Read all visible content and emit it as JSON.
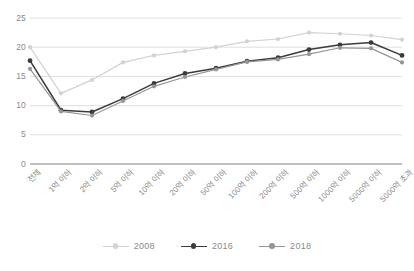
{
  "chart_data": {
    "type": "line",
    "title": "",
    "xlabel": "",
    "ylabel": "",
    "ylim": [
      0,
      25
    ],
    "yticks": [
      0,
      5,
      10,
      15,
      20,
      25
    ],
    "grid": true,
    "legend_position": "bottom",
    "categories": [
      "전체",
      "1억 이하",
      "2억 이하",
      "5억 이하",
      "10억 이하",
      "20억 이하",
      "50억 이하",
      "100억 이하",
      "200억 이하",
      "500억 이하",
      "1000억 이하",
      "5000억 이하",
      "5000억 초과"
    ],
    "series": [
      {
        "name": "2008",
        "color": "#d2d2d2",
        "values": [
          20.0,
          12.1,
          14.4,
          17.4,
          18.6,
          19.3,
          20.0,
          21.0,
          21.4,
          22.5,
          22.3,
          22.0,
          21.3
        ]
      },
      {
        "name": "2016",
        "color": "#3b3b3b",
        "values": [
          17.7,
          9.2,
          8.9,
          11.2,
          13.8,
          15.5,
          16.4,
          17.6,
          18.2,
          19.6,
          20.4,
          20.8,
          18.6
        ]
      },
      {
        "name": "2018",
        "color": "#969696",
        "values": [
          16.3,
          9.0,
          8.3,
          10.8,
          13.3,
          14.9,
          16.2,
          17.5,
          17.9,
          18.8,
          19.9,
          19.8,
          17.4
        ]
      }
    ]
  },
  "axis": {
    "y_tick_labels": [
      "25",
      "20",
      "15",
      "10",
      "5",
      "0"
    ],
    "y_tick_values": [
      25,
      20,
      15,
      10,
      5,
      0
    ]
  },
  "legend": {
    "items": [
      {
        "label": "2008",
        "color": "#d2d2d2"
      },
      {
        "label": "2016",
        "color": "#3b3b3b"
      },
      {
        "label": "2018",
        "color": "#969696"
      }
    ]
  },
  "colors": {
    "grid": "#d9d9d9",
    "axis": "#808080",
    "text": "#8a8a8a",
    "background": "#ffffff"
  }
}
